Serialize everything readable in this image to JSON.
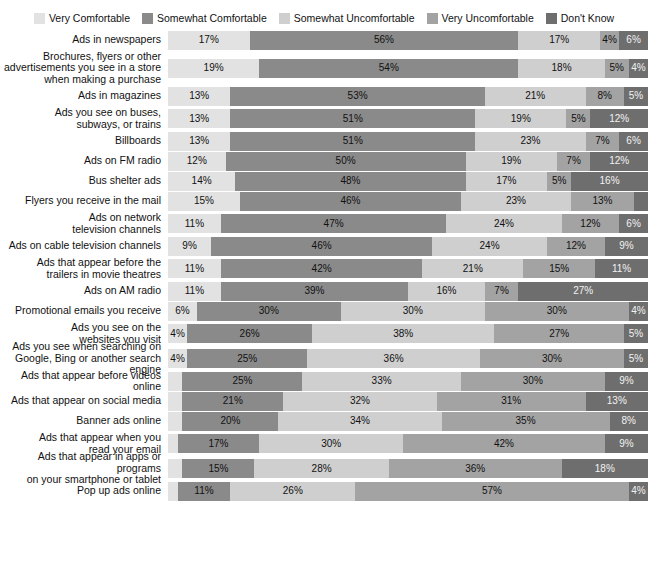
{
  "legend": {
    "items": [
      {
        "label": "Very Comfortable",
        "color": "#e2e2e2",
        "key": "very_comfortable"
      },
      {
        "label": "Somewhat Comfortable",
        "color": "#8a8a8a",
        "key": "somewhat_comfortable"
      },
      {
        "label": "Somewhat Uncomfortable",
        "color": "#cfcfcf",
        "key": "somewhat_uncomfortable"
      },
      {
        "label": "Very Uncomfortable",
        "color": "#a3a3a3",
        "key": "very_uncomfortable"
      },
      {
        "label": "Don't Know",
        "color": "#6e6e6e",
        "key": "dont_know"
      }
    ]
  },
  "chart_data": {
    "type": "bar",
    "subtype": "stacked-horizontal-100",
    "title": "",
    "xlabel": "",
    "ylabel": "",
    "xlim": [
      0,
      100
    ],
    "grid": false,
    "legend_position": "top-center",
    "value_suffix": "%",
    "series": [
      {
        "name": "Very Comfortable",
        "color": "#e2e2e2",
        "text_color": "#111111"
      },
      {
        "name": "Somewhat Comfortable",
        "color": "#8a8a8a",
        "text_color": "#111111"
      },
      {
        "name": "Somewhat Uncomfortable",
        "color": "#cfcfcf",
        "text_color": "#111111"
      },
      {
        "name": "Very Uncomfortable",
        "color": "#a3a3a3",
        "text_color": "#111111"
      },
      {
        "name": "Don't Know",
        "color": "#6e6e6e",
        "text_color": "#f2f2f2"
      }
    ],
    "categories": [
      "Ads in newspapers",
      "Brochures, flyers or other advertisements you see in a store when making a purchase",
      "Ads in magazines",
      "Ads you see on buses, subways, or trains",
      "Billboards",
      "Ads on FM radio",
      "Bus shelter ads",
      "Flyers you receive in the mail",
      "Ads on network television channels",
      "Ads on cable television channels",
      "Ads that appear before the trailers in movie theatres",
      "Ads on AM radio",
      "Promotional emails you receive",
      "Ads you see on the websites you visit",
      "Ads you see when searching on Google, Bing or another search engine",
      "Ads that appear before videos online",
      "Ads that appear on social media",
      "Banner ads online",
      "Ads that appear when you read your email",
      "Ads that appear in apps or programs on your smartphone or tablet",
      "Pop up ads online"
    ],
    "rows": [
      {
        "label_lines": [
          "Ads in newspapers"
        ],
        "values": [
          17,
          56,
          17,
          4,
          6
        ],
        "labels": [
          "17%",
          "56%",
          "17%",
          "4%",
          "6%"
        ]
      },
      {
        "label_lines": [
          "Brochures, flyers or other",
          "advertisements you see in a store",
          "when making a purchase"
        ],
        "values": [
          19,
          54,
          18,
          5,
          4
        ],
        "labels": [
          "19%",
          "54%",
          "18%",
          "5%",
          "4%"
        ]
      },
      {
        "label_lines": [
          "Ads in magazines"
        ],
        "values": [
          13,
          53,
          21,
          8,
          5
        ],
        "labels": [
          "13%",
          "53%",
          "21%",
          "8%",
          "5%"
        ]
      },
      {
        "label_lines": [
          "Ads you see on buses,",
          "subways, or trains"
        ],
        "values": [
          13,
          51,
          19,
          5,
          12
        ],
        "labels": [
          "13%",
          "51%",
          "19%",
          "5%",
          "12%"
        ]
      },
      {
        "label_lines": [
          "Billboards"
        ],
        "values": [
          13,
          51,
          23,
          7,
          6
        ],
        "labels": [
          "13%",
          "51%",
          "23%",
          "7%",
          "6%"
        ]
      },
      {
        "label_lines": [
          "Ads on FM radio"
        ],
        "values": [
          12,
          50,
          19,
          7,
          12
        ],
        "labels": [
          "12%",
          "50%",
          "19%",
          "7%",
          "12%"
        ]
      },
      {
        "label_lines": [
          "Bus shelter ads"
        ],
        "values": [
          14,
          48,
          17,
          5,
          16
        ],
        "labels": [
          "14%",
          "48%",
          "17%",
          "5%",
          "16%"
        ]
      },
      {
        "label_lines": [
          "Flyers you receive in the mail"
        ],
        "values": [
          15,
          46,
          23,
          13,
          3
        ],
        "labels": [
          "15%",
          "46%",
          "23%",
          "13%",
          "3%"
        ]
      },
      {
        "label_lines": [
          "Ads on network",
          "television channels"
        ],
        "values": [
          11,
          47,
          24,
          12,
          6
        ],
        "labels": [
          "11%",
          "47%",
          "24%",
          "12%",
          "6%"
        ]
      },
      {
        "label_lines": [
          "Ads on cable television channels"
        ],
        "values": [
          9,
          46,
          24,
          12,
          9
        ],
        "labels": [
          "9%",
          "46%",
          "24%",
          "12%",
          "9%"
        ]
      },
      {
        "label_lines": [
          "Ads that appear before the",
          "trailers in movie theatres"
        ],
        "values": [
          11,
          42,
          21,
          15,
          11
        ],
        "labels": [
          "11%",
          "42%",
          "21%",
          "15%",
          "11%"
        ]
      },
      {
        "label_lines": [
          "Ads on AM radio"
        ],
        "values": [
          11,
          39,
          16,
          7,
          27
        ],
        "labels": [
          "11%",
          "39%",
          "16%",
          "7%",
          "27%"
        ]
      },
      {
        "label_lines": [
          "Promotional emails you receive"
        ],
        "values": [
          6,
          30,
          30,
          30,
          4
        ],
        "labels": [
          "6%",
          "30%",
          "30%",
          "30%",
          "4%"
        ]
      },
      {
        "label_lines": [
          "Ads you see on the",
          "websites you visit"
        ],
        "values": [
          4,
          26,
          38,
          27,
          5
        ],
        "labels": [
          "4%",
          "26%",
          "38%",
          "27%",
          "5%"
        ]
      },
      {
        "label_lines": [
          "Ads you see when searching on",
          "Google, Bing or another search engine"
        ],
        "values": [
          4,
          25,
          36,
          30,
          5
        ],
        "labels": [
          "4%",
          "25%",
          "36%",
          "30%",
          "5%"
        ]
      },
      {
        "label_lines": [
          "Ads that appear before videos online"
        ],
        "values": [
          3,
          25,
          33,
          30,
          9
        ],
        "labels": [
          "3%",
          "25%",
          "33%",
          "30%",
          "9%"
        ]
      },
      {
        "label_lines": [
          "Ads that appear on social media"
        ],
        "values": [
          3,
          21,
          32,
          31,
          13
        ],
        "labels": [
          "3%",
          "21%",
          "32%",
          "31%",
          "13%"
        ]
      },
      {
        "label_lines": [
          "Banner ads online"
        ],
        "values": [
          3,
          20,
          34,
          35,
          8
        ],
        "labels": [
          "3%",
          "20%",
          "34%",
          "35%",
          "8%"
        ]
      },
      {
        "label_lines": [
          "Ads that appear when you",
          "read your email"
        ],
        "values": [
          2,
          17,
          30,
          42,
          9
        ],
        "labels": [
          "2%",
          "17%",
          "30%",
          "42%",
          "9%"
        ]
      },
      {
        "label_lines": [
          "Ads that appear in apps or programs",
          "on your smartphone or tablet"
        ],
        "values": [
          3,
          15,
          28,
          36,
          18
        ],
        "labels": [
          "3%",
          "15%",
          "28%",
          "36%",
          "18%"
        ]
      },
      {
        "label_lines": [
          "Pop up ads online"
        ],
        "values": [
          2,
          11,
          26,
          57,
          4
        ],
        "labels": [
          "2%",
          "11%",
          "26%",
          "57%",
          "4%"
        ]
      }
    ]
  }
}
